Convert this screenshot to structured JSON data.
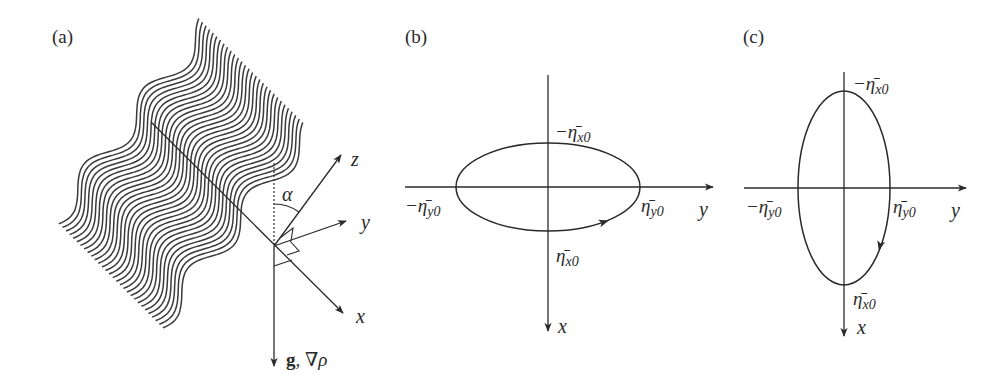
{
  "colors": {
    "ink": "#2a2a2a",
    "wave": "#3a3a3a",
    "background": "#ffffff"
  },
  "panels": {
    "a": {
      "label": "(a)",
      "axes": {
        "x_label": "x",
        "y_label": "y",
        "z_label": "z",
        "angle_label": "α",
        "gravity_label_bold": "g",
        "gravity_label_rest": ", ∇ρ"
      },
      "wave_band": {
        "line_count": 30,
        "description": "stack of parallel sinusoidal wave crests (internal wave beam)"
      }
    },
    "b": {
      "label": "(b)",
      "horizontal_axis_label": "y",
      "vertical_axis_label": "x",
      "labels": {
        "top": "−η̄",
        "top_sub": "x0",
        "bottom": "η̄",
        "bottom_sub": "x0",
        "left": "−η̄",
        "left_sub": "y0",
        "right": "η̄",
        "right_sub": "y0"
      },
      "ellipse": {
        "orientation": "horizontal (wide)",
        "rotation": "clockwise"
      }
    },
    "c": {
      "label": "(c)",
      "horizontal_axis_label": "y",
      "vertical_axis_label": "x",
      "labels": {
        "top": "−η̄",
        "top_sub": "x0",
        "bottom": "η̄",
        "bottom_sub": "x0",
        "left": "−η̄",
        "left_sub": "y0",
        "right": "η̄",
        "right_sub": "y0"
      },
      "ellipse": {
        "orientation": "vertical (tall)",
        "rotation": "clockwise"
      }
    }
  }
}
